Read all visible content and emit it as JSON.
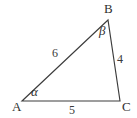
{
  "figure": {
    "kind": "triangle-diagram",
    "background_color": "#ffffff",
    "stroke_color": "#3c3c3c",
    "text_color": "#303030"
  },
  "vertices": [
    {
      "id": "A",
      "label": "A",
      "x": 22,
      "y": 101
    },
    {
      "id": "B",
      "label": "B",
      "x": 108,
      "y": 20
    },
    {
      "id": "C",
      "label": "C",
      "x": 120,
      "y": 101
    }
  ],
  "sides": [
    {
      "id": "AB",
      "label": "6",
      "from": "A",
      "to": "B"
    },
    {
      "id": "BC",
      "label": "4",
      "from": "B",
      "to": "C"
    },
    {
      "id": "AC",
      "label": "5",
      "from": "A",
      "to": "C"
    }
  ],
  "angles": [
    {
      "id": "alpha",
      "at": "A",
      "label": "α"
    },
    {
      "id": "beta",
      "at": "B",
      "label": "β"
    }
  ],
  "chart_data": {
    "type": "diagram",
    "title": "",
    "shape": "triangle",
    "points": {
      "A": [
        22,
        101
      ],
      "B": [
        108,
        20
      ],
      "C": [
        120,
        101
      ]
    },
    "edge_lengths": {
      "AB": 6,
      "BC": 4,
      "AC": 5
    },
    "angle_labels": {
      "A": "α",
      "B": "β",
      "C": ""
    },
    "grid": false,
    "legend": false
  }
}
